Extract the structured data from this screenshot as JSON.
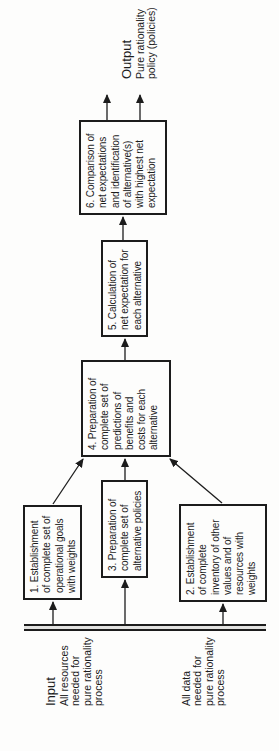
{
  "flow": {
    "colors": {
      "ink": "#1c1c1c",
      "paper": "#fdfdfc"
    },
    "input": {
      "heading": "Input",
      "resources_label": [
        "All resources",
        "needed for",
        "pure rationality",
        "process"
      ],
      "data_label": [
        "All data",
        "needed for",
        "pure rationality",
        "process"
      ]
    },
    "output": {
      "heading": "Output",
      "label": [
        "Pure rationality",
        "policy (policies)"
      ]
    },
    "steps": {
      "s1": [
        "1. Establishment",
        "of complete set of",
        "operational goals",
        "with weights"
      ],
      "s2": [
        "2. Establishment",
        "of complete",
        "inventory of other",
        "values and of",
        "resources with",
        "weights"
      ],
      "s3": [
        "3. Preparation of",
        "complete set of",
        "alternative policies"
      ],
      "s4": [
        "4. Preparation of",
        "complete set of",
        "predictions of",
        "benefits and",
        "costs for each",
        "alternative"
      ],
      "s5": [
        "5. Calculation of",
        "net expectation for",
        "each alternative"
      ],
      "s6": [
        "6. Comparison of",
        "net expectations",
        "and identification",
        "of alternative(s)",
        "with highest net",
        "expectation"
      ]
    }
  }
}
